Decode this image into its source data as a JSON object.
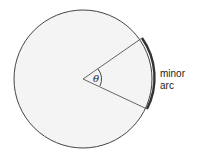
{
  "diagram": {
    "angle_label": "θ",
    "arc_label_line1": "minor",
    "arc_label_line2": "arc",
    "colors": {
      "fill": "#f4f4f4",
      "stroke": "#444444",
      "arc": "#333333"
    }
  }
}
